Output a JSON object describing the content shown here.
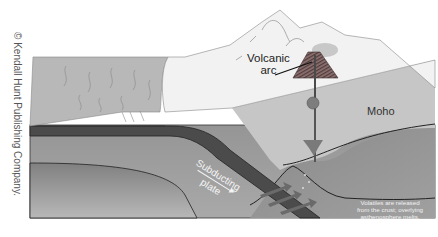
{
  "copyright": "© Kendall Hunt Publishing Company.",
  "labels": {
    "volcanic_arc_line1": "Volcanic",
    "volcanic_arc_line2": "arc",
    "moho": "Moho",
    "subducting_line1": "Subducting",
    "subducting_line2": "plate",
    "volatiles_line1": "Volatiles are released",
    "volatiles_line2": "from the crust; overlying",
    "volatiles_line3": "asthenosphere melts."
  },
  "colors": {
    "ocean_surface": "#b9b9b9",
    "continent": "#f1f1f1",
    "crust": "#c4c4c4",
    "plate": "#4a4a4a",
    "mantle": "#8e8e8e",
    "asthenosphere": "#7a7a7a",
    "volcano": "#6e5a5a"
  }
}
